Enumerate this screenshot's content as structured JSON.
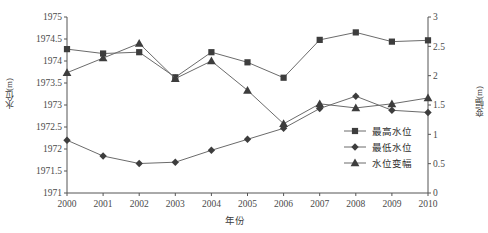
{
  "chart_data": {
    "type": "line",
    "title": "",
    "xlabel": "年份",
    "ylabel": "水位(m)",
    "y2label": "变幅(m)",
    "grid": false,
    "legend_position": "inside-right",
    "categories": [
      "2000",
      "2001",
      "2002",
      "2003",
      "2004",
      "2005",
      "2006",
      "2007",
      "2008",
      "2009",
      "2010"
    ],
    "x": [
      2000,
      2001,
      2002,
      2003,
      2004,
      2005,
      2006,
      2007,
      2008,
      2009,
      2010
    ],
    "ylim": [
      1971,
      1975
    ],
    "yticks": [
      "1971",
      "1971.5",
      "1972",
      "1972.5",
      "1973",
      "1973.5",
      "1974",
      "1974.5",
      "1975"
    ],
    "ytick_values": [
      1971,
      1971.5,
      1972,
      1972.5,
      1973,
      1973.5,
      1974,
      1974.5,
      1975
    ],
    "y2lim": [
      0,
      3
    ],
    "y2ticks": [
      "0",
      "0.5",
      "1",
      "1.5",
      "2",
      "2.5",
      "3"
    ],
    "y2tick_values": [
      0,
      0.5,
      1,
      1.5,
      2,
      2.5,
      3
    ],
    "xticks": [
      "2000",
      "2001",
      "2002",
      "2003",
      "2004",
      "2005",
      "2006",
      "2007",
      "2008",
      "2009",
      "2010"
    ],
    "series": [
      {
        "name": "最高水位",
        "axis": "left",
        "marker": "square",
        "color": "#3d3d3d",
        "values": [
          1974.27,
          1974.17,
          1974.2,
          1973.63,
          1974.2,
          1973.97,
          1973.62,
          1974.48,
          1974.65,
          1974.44,
          1974.47
        ]
      },
      {
        "name": "最低水位",
        "axis": "left",
        "marker": "diamond",
        "color": "#3d3d3d",
        "values": [
          1972.2,
          1971.84,
          1971.67,
          1971.7,
          1971.97,
          1972.22,
          1972.47,
          1972.92,
          1973.2,
          1972.88,
          1972.83
        ]
      },
      {
        "name": "水位变幅",
        "axis": "right",
        "marker": "triangle",
        "color": "#3d3d3d",
        "values": [
          2.05,
          2.3,
          2.55,
          1.95,
          2.25,
          1.75,
          1.18,
          1.52,
          1.45,
          1.52,
          1.62
        ]
      }
    ]
  },
  "legend": {
    "items": [
      {
        "label": "最高水位",
        "marker": "square"
      },
      {
        "label": "最低水位",
        "marker": "diamond"
      },
      {
        "label": "水位变幅",
        "marker": "triangle"
      }
    ]
  }
}
